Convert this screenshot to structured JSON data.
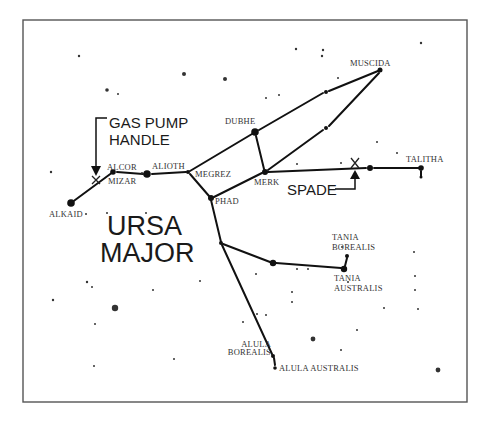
{
  "title": {
    "line1": "URSA",
    "line2": "MAJOR"
  },
  "callouts": {
    "gas_pump": {
      "line1": "GAS PUMP",
      "line2": "HANDLE"
    },
    "spade": "SPADE"
  },
  "stars": {
    "muscida": "MUSCIDA",
    "dubhe": "DUBHE",
    "megrez": "MEGREZ",
    "merk": "MERK",
    "phad": "PHAD",
    "alioth": "ALIOTH",
    "alcor": "ALCOR",
    "mizar": "MIZAR",
    "alkaid": "ALKAID",
    "talitha": "TALITHA",
    "tania_borealis": {
      "line1": "TANIA",
      "line2": "BOREALIS"
    },
    "tania_australis": {
      "line1": "TANIA",
      "line2": "AUSTRALIS"
    },
    "alula_borealis": {
      "line1": "ALULA",
      "line2": "BOREALIS"
    },
    "alula_australis": "ALULA AUSTRALIS"
  },
  "colors": {
    "ink": "#111111",
    "label": "#333333",
    "frame": "#555555",
    "background": "#ffffff"
  }
}
